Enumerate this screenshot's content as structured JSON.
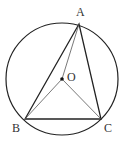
{
  "diagram": {
    "type": "geometry",
    "circle": {
      "cx": 62,
      "cy": 79,
      "r": 56,
      "center_label": "O"
    },
    "points": {
      "A": {
        "x": 79,
        "y": 24,
        "label": "A"
      },
      "B": {
        "x": 25,
        "y": 119,
        "label": "B"
      },
      "C": {
        "x": 101,
        "y": 119,
        "label": "C"
      },
      "O": {
        "x": 62,
        "y": 79,
        "label": "O"
      }
    },
    "labels": {
      "A": "A",
      "B": "B",
      "C": "C",
      "O": "O"
    },
    "colors": {
      "stroke": "#222222",
      "thin_stroke": "#555555",
      "background": "#ffffff"
    }
  }
}
